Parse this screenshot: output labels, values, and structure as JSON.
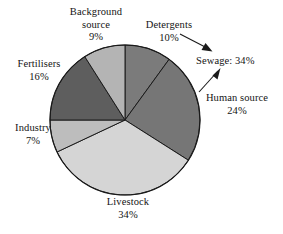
{
  "chart_data": {
    "type": "pie",
    "title": "",
    "subtitle": "",
    "xlabel": "",
    "ylabel": "",
    "legend_position": "none",
    "grid": false,
    "units": "percent",
    "total": 100,
    "categories": [
      "Detergents",
      "Human source",
      "Livestock",
      "Industry",
      "Fertilisers",
      "Background source"
    ],
    "values": [
      10,
      24,
      34,
      7,
      16,
      9
    ],
    "slices": [
      {
        "label": "Detergents",
        "value": 10,
        "value_text": "10%",
        "color": "#7b7b7b",
        "start_angle": 0,
        "end_angle": 36
      },
      {
        "label": "Human source",
        "value": 24,
        "value_text": "24%",
        "color": "#767676",
        "start_angle": 36,
        "end_angle": 122.4
      },
      {
        "label": "Livestock",
        "value": 34,
        "value_text": "34%",
        "color": "#d5d5d5",
        "start_angle": 122.4,
        "end_angle": 244.8
      },
      {
        "label": "Industry",
        "value": 7,
        "value_text": "7%",
        "color": "#bdbdbd",
        "start_angle": 244.8,
        "end_angle": 270.0
      },
      {
        "label": "Fertilisers",
        "value": 16,
        "value_text": "16%",
        "color": "#5e5e5e",
        "start_angle": 270.0,
        "end_angle": 327.6
      },
      {
        "label": "Background source",
        "value": 9,
        "value_text": "9%",
        "color": "#b4b4b4",
        "start_angle": 327.6,
        "end_angle": 360
      }
    ],
    "annotations": [
      {
        "text": "Sewage: 34%",
        "value": 34,
        "kind": "grouped-total",
        "points_from": [
          "Detergents",
          "Human source"
        ]
      }
    ]
  },
  "labels": {
    "background_source": {
      "line1": "Background",
      "line2": "source",
      "line3": "9%"
    },
    "detergents": {
      "line1": "Detergents",
      "line2": "10%"
    },
    "sewage": {
      "line1": "Sewage: 34%"
    },
    "human_source": {
      "line1": "Human source",
      "line2": "24%"
    },
    "fertilisers": {
      "line1": "Fertilisers",
      "line2": "16%"
    },
    "industry": {
      "line1": "Industry",
      "line2": "7%"
    },
    "livestock": {
      "line1": "Livestock",
      "line2": "34%"
    }
  },
  "style": {
    "stroke_color": "#1a1a1a",
    "background": "#ffffff",
    "text_color": "#141414"
  }
}
